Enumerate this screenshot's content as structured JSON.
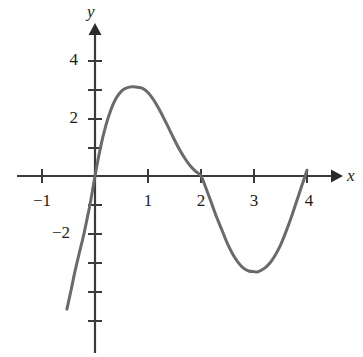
{
  "figure": {
    "kind": "cartesian-graph",
    "background": "#ffffff",
    "curve_color": "#6a6a6a",
    "axis_color": "#3a3a3a",
    "text_color": "#1b1b1b"
  },
  "axes": {
    "x_axis_label": "x",
    "y_axis_label": "y",
    "x_tick_labels": [
      "−1",
      "1",
      "2",
      "3",
      "4"
    ],
    "y_tick_labels": [
      "4",
      "2",
      "−2"
    ]
  },
  "chart_data": {
    "type": "line",
    "title": "",
    "xlabel": "x",
    "ylabel": "y",
    "grid": false,
    "legend": "none",
    "xlim": [
      -1.48,
      4.62
    ],
    "ylim": [
      -5.24,
      5.24
    ],
    "x_ticks": [
      -1,
      0,
      1,
      2,
      3,
      4
    ],
    "x_tick_labels": [
      "−1",
      "",
      "1",
      "2",
      "3",
      "4"
    ],
    "y_ticks": [
      -5,
      -4,
      -3,
      -2,
      -1,
      0,
      1,
      2,
      3,
      4,
      5
    ],
    "y_tick_labels": [
      "",
      "",
      "",
      "−2",
      "",
      "",
      "",
      "2",
      "",
      "4",
      ""
    ],
    "annotations": [
      {
        "text": "zero at x = 0",
        "x": 0,
        "y": 0
      },
      {
        "text": "zero at x = 2",
        "x": 2,
        "y": 0
      },
      {
        "text": "zero at x = 4",
        "x": 4,
        "y": 0
      },
      {
        "text": "local maximum",
        "x": 0.89,
        "y": 3.1
      },
      {
        "text": "local minimum",
        "x": 3.07,
        "y": -3.3
      }
    ],
    "series": [
      {
        "name": "curve",
        "color": "#6a6a6a",
        "x": [
          -0.53,
          -0.45,
          -0.38,
          -0.3,
          -0.22,
          -0.15,
          -0.08,
          0.0,
          0.1,
          0.2,
          0.3,
          0.4,
          0.5,
          0.6,
          0.7,
          0.8,
          0.89,
          1.0,
          1.1,
          1.2,
          1.3,
          1.4,
          1.5,
          1.6,
          1.7,
          1.8,
          1.9,
          2.0,
          2.1,
          2.2,
          2.3,
          2.4,
          2.5,
          2.6,
          2.7,
          2.8,
          2.9,
          3.0,
          3.07,
          3.2,
          3.3,
          3.4,
          3.5,
          3.6,
          3.7,
          3.8,
          3.9,
          4.0
        ],
        "y": [
          -4.62,
          -3.95,
          -3.33,
          -2.7,
          -2.1,
          -1.49,
          -0.85,
          0.0,
          0.96,
          1.72,
          2.3,
          2.71,
          2.95,
          3.06,
          3.1,
          3.08,
          3.05,
          2.9,
          2.66,
          2.35,
          2.0,
          1.63,
          1.25,
          0.9,
          0.6,
          0.35,
          0.16,
          0.0,
          -0.45,
          -0.95,
          -1.45,
          -1.9,
          -2.35,
          -2.72,
          -3.0,
          -3.2,
          -3.3,
          -3.32,
          -3.33,
          -3.2,
          -3.02,
          -2.75,
          -2.4,
          -1.95,
          -1.45,
          -0.9,
          -0.35,
          0.2
        ]
      }
    ]
  },
  "geometry": {
    "origin_px": [
      95,
      176
    ],
    "x_unit_px": 53,
    "y_unit_px": 28.8,
    "x_axis_start_px": 17,
    "x_axis_end_px": 341,
    "y_axis_top_px": 25,
    "y_axis_bottom_px": 353
  }
}
